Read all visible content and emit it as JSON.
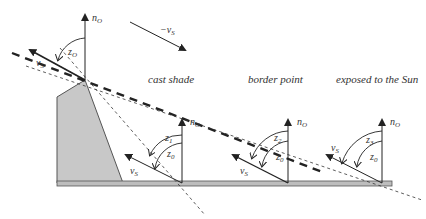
{
  "figure": {
    "colors": {
      "line": "#222222",
      "building_fill": "#c8c8c8",
      "building_stroke": "#555555",
      "base_fill": "#bdbdbd",
      "text": "#333333"
    },
    "top_arrow": {
      "label": "−v",
      "sub": "S"
    },
    "apex": {
      "normal": {
        "label": "n",
        "sub": "O"
      },
      "zenith": {
        "label": "z",
        "sub": "O"
      },
      "sun_vector": {
        "label": "v",
        "sub": "S"
      }
    },
    "regions": [
      {
        "id": "cast-shade",
        "title": "cast shade",
        "normal": {
          "label": "n",
          "sub": "O"
        },
        "angle_outer": {
          "label": "z",
          "sub": "1"
        },
        "angle_inner": {
          "label": "z",
          "sub": "0"
        },
        "sun_vector": {
          "label": "v",
          "sub": "S"
        }
      },
      {
        "id": "border-point",
        "title": "border point",
        "normal": {
          "label": "n",
          "sub": "O"
        },
        "angle_outer": {
          "label": "z",
          "sub": "2"
        },
        "angle_inner": {
          "label": "z",
          "sub": "0"
        },
        "sun_vector": {
          "label": "v",
          "sub": "S"
        }
      },
      {
        "id": "exposed",
        "title": "exposed to the Sun",
        "normal": {
          "label": "n",
          "sub": "O"
        },
        "angle_outer": {
          "label": "z",
          "sub": "3"
        },
        "angle_inner": {
          "label": "z",
          "sub": "0"
        },
        "sun_vector": {
          "label": "v",
          "sub": "S"
        }
      }
    ]
  }
}
